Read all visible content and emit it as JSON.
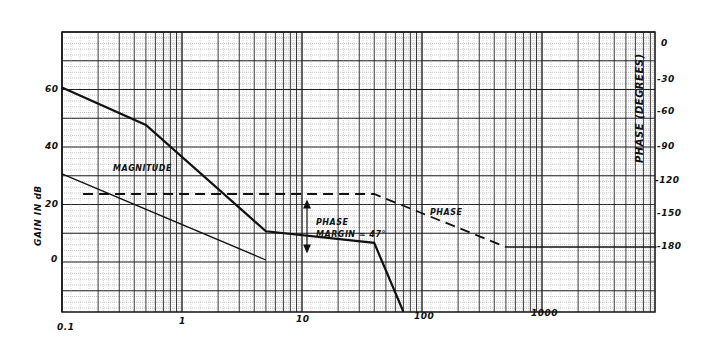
{
  "chart_data": {
    "type": "line",
    "title": "",
    "xlabel": "",
    "ylabel": "GAIN IN dB",
    "y2label": "PHASE (DEGREES)",
    "x_scale": "log",
    "xlim": [
      0.1,
      9000
    ],
    "ylim": [
      -20,
      80
    ],
    "y2lim": [
      -180,
      0
    ],
    "grid": true,
    "x_ticks": [
      "0.1",
      "1",
      "10",
      "100",
      "1000"
    ],
    "y_ticks": [
      "60",
      "40",
      "20",
      "0"
    ],
    "y2_ticks": [
      "0",
      "-30",
      "-60",
      "-90",
      "-120",
      "-150",
      "-180"
    ],
    "series": [
      {
        "name": "Magnitude (compensated)",
        "style": "solid-thick",
        "x": [
          0.1,
          0.5,
          5,
          40,
          70
        ],
        "y": [
          60,
          47,
          10,
          6,
          -18
        ]
      },
      {
        "name": "Magnitude (uncompensated)",
        "style": "solid-thin",
        "x": [
          0.1,
          5
        ],
        "y": [
          30,
          0
        ]
      },
      {
        "name": "Phase",
        "style": "dashed",
        "axis": "y2",
        "x": [
          0.15,
          40,
          500,
          9000
        ],
        "y": [
          -133,
          -133,
          -180,
          -180
        ]
      }
    ],
    "annotations": [
      {
        "text": "MAGNITUDE",
        "x": 0.3,
        "y": 34
      },
      {
        "text": "PHASE",
        "x": 150,
        "y": -140
      },
      {
        "text": "PHASE MARGIN ≈ 47°",
        "x": 18,
        "y": 16,
        "arrow": "vertical double-headed between phase -133° and gain crossover"
      }
    ]
  },
  "labels": {
    "gain_axis": "GAIN IN dB",
    "phase_axis": "PHASE (DEGREES)",
    "magnitude": "MAGNITUDE",
    "phase": "PHASE",
    "phase_margin_1": "PHASE",
    "phase_margin_2": "MARGIN ≈ 47°"
  },
  "ticks": {
    "x": [
      "0.1",
      "1",
      "10",
      "100",
      "1000"
    ],
    "y_left": [
      "60",
      "40",
      "20",
      "0"
    ],
    "y_right": [
      "0",
      "-30",
      "-60",
      "-90",
      "-120",
      "-150",
      "-180"
    ]
  }
}
